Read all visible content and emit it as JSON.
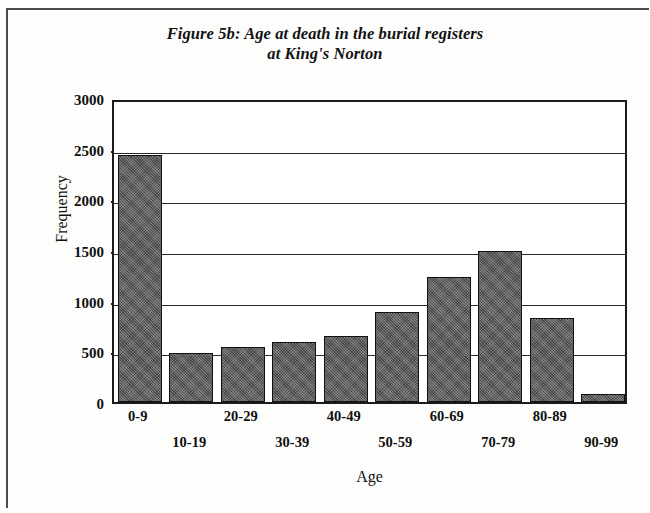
{
  "figure": {
    "title_line1": "Figure 5b: Age at death in the burial registers",
    "title_line2": "at King's Norton"
  },
  "chart_data": {
    "type": "bar",
    "title": "Figure 5b: Age at death in the burial registers at King's Norton",
    "xlabel": "Age",
    "ylabel": "Frequency",
    "categories": [
      "0-9",
      "10-19",
      "20-29",
      "30-39",
      "40-49",
      "50-59",
      "60-69",
      "70-79",
      "80-89",
      "90-99"
    ],
    "values": [
      2440,
      480,
      540,
      590,
      650,
      890,
      1230,
      1490,
      830,
      80
    ],
    "ylim": [
      0,
      3000
    ],
    "yticks": [
      0,
      500,
      1000,
      1500,
      2000,
      2500,
      3000
    ],
    "ytick_labels": [
      "0",
      "500",
      "1000",
      "1500",
      "2000",
      "2500",
      "3000"
    ],
    "grid": true,
    "legend": "none",
    "bar_color": "#5c5c5c",
    "bar_edge_color": "#111111",
    "axis_color": "#1b1b1b"
  }
}
